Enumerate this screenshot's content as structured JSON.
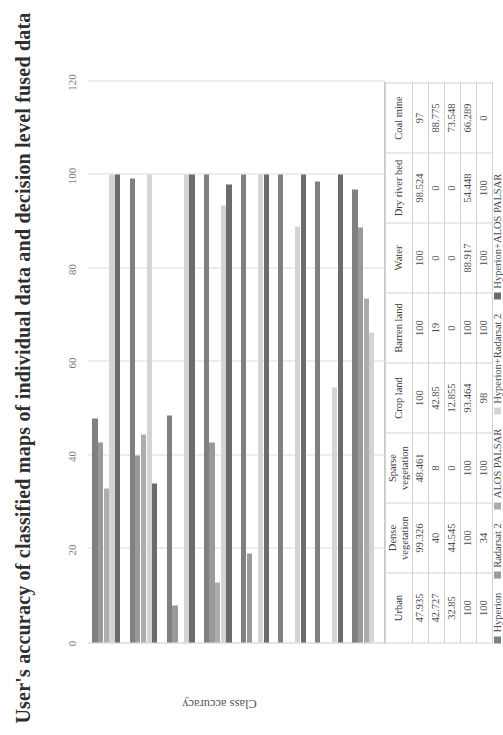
{
  "title": "User's accuracy of classified maps of individual data and decision level fused data",
  "axis": {
    "value_axis_title": "Class accuracy",
    "ticks": [
      "0",
      "20",
      "40",
      "60",
      "80",
      "100",
      "120"
    ],
    "min": 0,
    "max": 120
  },
  "legend": {
    "items": [
      {
        "label": "Hyperion",
        "color": "#808080"
      },
      {
        "label": "Radarsat 2",
        "color": "#9a9a9a"
      },
      {
        "label": "ALOS PALSAR",
        "color": "#adadad"
      },
      {
        "label": "Hyperion+Radarsat 2",
        "color": "#d4d4d4"
      },
      {
        "label": "Hyperion+ALOS PALSAR",
        "color": "#6b6b6b"
      }
    ]
  },
  "chart_data": {
    "type": "bar",
    "title": "User's accuracy of classified maps of individual data and decision level fused data",
    "xlabel": "",
    "ylabel": "Class accuracy",
    "ylim": [
      0,
      120
    ],
    "grid": true,
    "legend_position": "bottom",
    "orientation": "horizontal",
    "categories": [
      "Urban",
      "Dense vegetation",
      "Sparse vegetation",
      "Crop land",
      "Barren land",
      "Water",
      "Dry river bed",
      "Coal mine"
    ],
    "series": [
      {
        "name": "Hyperion",
        "values": [
          47.935,
          99.326,
          48.461,
          100,
          100,
          100,
          98.524,
          97
        ]
      },
      {
        "name": "Radarsat 2",
        "values": [
          42.727,
          40,
          8,
          42.85,
          19,
          0,
          0,
          88.775
        ]
      },
      {
        "name": "ALOS PALSAR",
        "values": [
          32.85,
          44.545,
          0,
          12.855,
          0,
          0,
          0,
          73.548
        ]
      },
      {
        "name": "Hyperion+Radarsat 2",
        "values": [
          100,
          100,
          100,
          93.464,
          100,
          88.917,
          54.448,
          66.289
        ]
      },
      {
        "name": "Hyperion+ALOS PALSAR",
        "values": [
          100,
          34,
          100,
          98,
          100,
          100,
          100,
          0
        ]
      }
    ]
  },
  "table": {
    "row_labels": [
      "Hyperion",
      "Radarsat 2",
      "ALOS PALSAR",
      "Hyperion+Radarsat 2",
      "Hyperion+ALOS PALSAR"
    ],
    "columns": [
      "Urban",
      "Dense vegetation",
      "Sparse vegetation",
      "Crop land",
      "Barren land",
      "Water",
      "Dry river bed",
      "Coal mine"
    ],
    "rows": [
      [
        "47.935",
        "99.326",
        "48.461",
        "100",
        "100",
        "100",
        "98.524",
        "97"
      ],
      [
        "42.727",
        "40",
        "8",
        "42.85",
        "19",
        "0",
        "0",
        "88.775"
      ],
      [
        "32.85",
        "44.545",
        "0",
        "12.855",
        "0",
        "0",
        "0",
        "73.548"
      ],
      [
        "100",
        "100",
        "100",
        "93.464",
        "100",
        "88.917",
        "54.448",
        "66.289"
      ],
      [
        "100",
        "34",
        "100",
        "98",
        "100",
        "100",
        "100",
        "0"
      ]
    ]
  }
}
